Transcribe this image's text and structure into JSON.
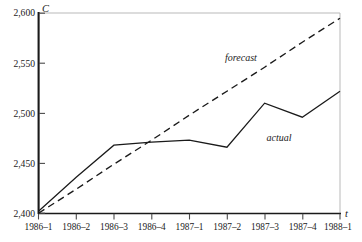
{
  "chart_data": {
    "type": "line",
    "title": "",
    "xlabel": "t",
    "ylabel": "C",
    "ylim": [
      2400,
      2600
    ],
    "xlim": [
      0,
      8
    ],
    "grid": false,
    "legend_position": "inline-annotation",
    "categories": [
      "1986–1",
      "1986–2",
      "1986–3",
      "1986–4",
      "1987–1",
      "1987–2",
      "1987–3",
      "1987–4",
      "1988–1"
    ],
    "ytick_labels": [
      "2,400",
      "2,450",
      "2,500",
      "2,550",
      "2,600"
    ],
    "ytick_values": [
      2400,
      2450,
      2500,
      2550,
      2600
    ],
    "series": [
      {
        "name": "actual",
        "style": "solid",
        "color": "#1a1a1a",
        "values": [
          2402,
          2436,
          2468,
          2471,
          2473,
          2466,
          2510,
          2496,
          2522
        ]
      },
      {
        "name": "forecast",
        "style": "dashed",
        "color": "#1a1a1a",
        "values": [
          2400,
          2424,
          2449,
          2473,
          2498,
          2522,
          2546,
          2571,
          2595
        ]
      }
    ],
    "annotations": [
      {
        "text": "forecast",
        "x_index": 4.95,
        "value": 2552
      },
      {
        "text": "actual",
        "x_index": 6.05,
        "value": 2472
      }
    ]
  },
  "axes": {
    "y_axis_name": "C",
    "x_axis_name": "t"
  }
}
